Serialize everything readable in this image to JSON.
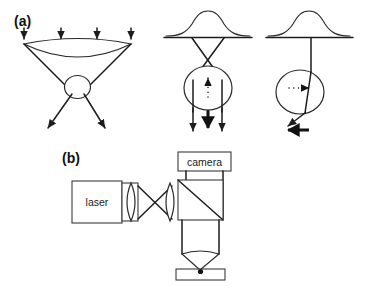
{
  "figure": {
    "background_color": "#ffffff",
    "line_color": "#2a2a2a",
    "bold_line_color": "#111111",
    "width": 365,
    "height": 286
  },
  "panels": [
    {
      "id": "panel-a",
      "label": "(a)",
      "label_x": 14,
      "label_y": 26,
      "caption": "Ray-optics explanation of the gradient force on a dielectric bead",
      "diagrams": [
        {
          "id": "diagram-a1",
          "name": "focused-beam-through-bead",
          "description": "Collimated rays enter a converging lens, focus through a spherical bead and diverge",
          "incoming_arrow_count": 4,
          "outgoing_arrow_count": 2,
          "bead_label": "",
          "has_lens": true,
          "has_bead": true
        },
        {
          "id": "diagram-a2",
          "name": "axial-gradient-force",
          "description": "Gaussian intensity profile, crossing rays, bead displaced axially, net restoring force points up; momentum change sends rays downward",
          "profile_type": "gaussian",
          "internal_arrow_direction": "up",
          "internal_arrow_style": "dotted",
          "outgoing_arrow_count": 3,
          "bold_arrow_index": 1,
          "has_bead": true
        },
        {
          "id": "diagram-a3",
          "name": "lateral-gradient-force",
          "description": "Gaussian intensity profile, single off-axis ray refracts through bead, net restoring force points left, bead pulled toward beam axis",
          "profile_type": "gaussian",
          "internal_arrow_direction": "right",
          "internal_arrow_style": "dotted",
          "outgoing_arrow_count": 1,
          "bold_arrow_direction": "left",
          "has_bead": true
        }
      ]
    },
    {
      "id": "panel-b",
      "label": "(b)",
      "label_x": 62,
      "label_y": 163,
      "caption": "Schematic of the optical tweezers instrument",
      "components": [
        {
          "id": "laser-source",
          "name": "laser-box",
          "label": "laser",
          "label_x": 104,
          "label_y": 202,
          "type": "source-box"
        },
        {
          "id": "camera-detector",
          "name": "camera-box",
          "label": "camera",
          "label_x": 204,
          "label_y": 162,
          "type": "detector-box"
        },
        {
          "id": "collimating-lens",
          "name": "laser-output-lens",
          "label": "",
          "type": "lens"
        },
        {
          "id": "relay-lens",
          "name": "relay-lens",
          "label": "",
          "type": "lens"
        },
        {
          "id": "beam-splitter",
          "name": "beam-splitter-cube",
          "label": "",
          "type": "cube-with-diagonal"
        },
        {
          "id": "objective",
          "name": "objective-lens",
          "label": "",
          "type": "objective-barrel"
        },
        {
          "id": "sample-chamber",
          "name": "sample-chamber",
          "label": "",
          "type": "flow-cell",
          "trapped_bead": true
        }
      ]
    }
  ]
}
